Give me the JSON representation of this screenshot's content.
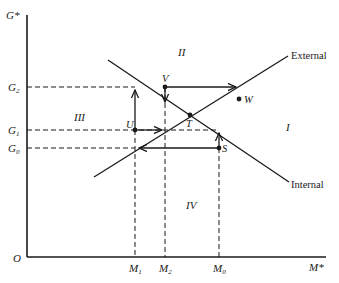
{
  "diagram": {
    "axes": {
      "y_label": "G*",
      "x_label": "M*",
      "origin_label": "O"
    },
    "y_ticks": [
      {
        "id": "G2",
        "label": "G",
        "sub": "2"
      },
      {
        "id": "G1",
        "label": "G",
        "sub": "1"
      },
      {
        "id": "G0",
        "label": "G",
        "sub": "0"
      }
    ],
    "x_ticks": [
      {
        "id": "M1",
        "label": "M",
        "sub": "1"
      },
      {
        "id": "M2",
        "label": "M",
        "sub": "2"
      },
      {
        "id": "M0",
        "label": "M",
        "sub": "0"
      }
    ],
    "lines": [
      {
        "id": "external",
        "label": "External"
      },
      {
        "id": "internal",
        "label": "Internal"
      }
    ],
    "points": [
      {
        "id": "T",
        "label": "T"
      },
      {
        "id": "U",
        "label": "U"
      },
      {
        "id": "V",
        "label": "V"
      },
      {
        "id": "S",
        "label": "S"
      },
      {
        "id": "W",
        "label": "W"
      }
    ],
    "regions": [
      {
        "id": "I",
        "label": "I"
      },
      {
        "id": "II",
        "label": "II"
      },
      {
        "id": "III",
        "label": "III"
      },
      {
        "id": "IV",
        "label": "IV"
      }
    ]
  }
}
